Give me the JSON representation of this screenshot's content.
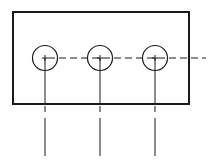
{
  "diagram": {
    "type": "technical-drawing",
    "stroke_color": "#1a1a1a",
    "background": "#ffffff",
    "plate": {
      "x": 13,
      "y": 12,
      "width": 176,
      "height": 92,
      "stroke_width": 2
    },
    "holes": [
      {
        "id": "hole-1",
        "cx": 45,
        "cy": 58,
        "r": 12.5
      },
      {
        "id": "hole-2",
        "cx": 100,
        "cy": 58,
        "r": 12.5
      },
      {
        "id": "hole-3",
        "cx": 155,
        "cy": 58,
        "r": 12.5
      }
    ],
    "center_line": {
      "x1": 48,
      "x2": 206,
      "y": 58,
      "dash": "7,4"
    },
    "projection_lines": [
      {
        "x": 45,
        "y_top": 58,
        "y_rect_bottom": 104,
        "dash_y1": 106,
        "dash_y2": 112,
        "long_y1": 118,
        "long_y2": 156
      },
      {
        "x": 100,
        "y_top": 58,
        "y_rect_bottom": 104,
        "dash_y1": 106,
        "dash_y2": 112,
        "long_y1": 118,
        "long_y2": 156
      },
      {
        "x": 155,
        "y_top": 58,
        "y_rect_bottom": 104,
        "dash_y1": 106,
        "dash_y2": 112,
        "long_y1": 118,
        "long_y2": 156
      }
    ]
  }
}
